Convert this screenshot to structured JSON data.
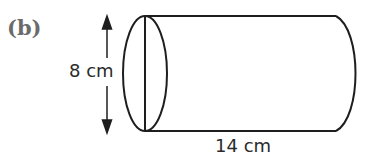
{
  "figure": {
    "label": "(b)",
    "shape": "cylinder",
    "dimensions": {
      "diameter": "8 cm",
      "length": "14 cm"
    }
  }
}
